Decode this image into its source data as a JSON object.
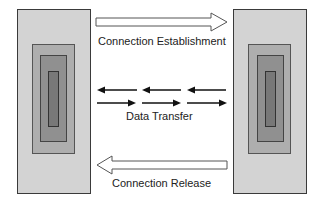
{
  "diagram": {
    "phases": [
      {
        "label": "Connection Establishment",
        "direction": "right"
      },
      {
        "label": "Data Transfer",
        "direction": "both"
      },
      {
        "label": "Connection Release",
        "direction": "left"
      }
    ],
    "hosts": [
      {
        "side": "left"
      },
      {
        "side": "right"
      }
    ],
    "colors": {
      "outer": "#d3d3d3",
      "mid": "#aeaeae",
      "inner": "#909090",
      "core": "#787878",
      "arrow": "#111111"
    }
  }
}
